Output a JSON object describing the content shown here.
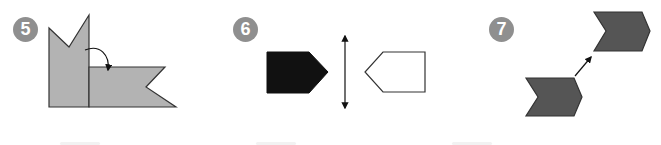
{
  "exercises": [
    {
      "number": "5",
      "description": "Rotation: gray notched flag rotated 90 degrees clockwise about a corner",
      "transformation": "rotation",
      "colors": {
        "fill": "#b3b3b3",
        "stroke": "#333333"
      }
    },
    {
      "number": "6",
      "description": "Reflection: black pentagon reflected across a vertical mirror line into a white outlined pentagon",
      "transformation": "reflection",
      "colors": {
        "fill": "#111111",
        "image_fill": "#ffffff",
        "stroke": "#333333"
      }
    },
    {
      "number": "7",
      "description": "Translation: dark gray chevron translated diagonally up and to the right",
      "transformation": "translation",
      "colors": {
        "fill": "#555555",
        "stroke": "#333333"
      }
    }
  ],
  "badge_color": "#8f8f8f"
}
